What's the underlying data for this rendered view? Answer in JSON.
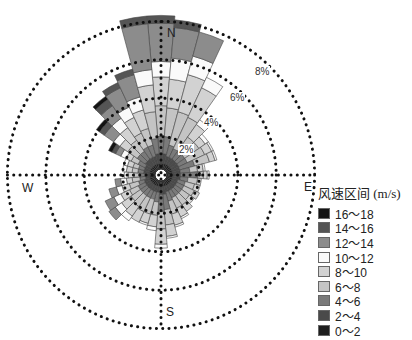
{
  "chart_data": {
    "type": "windrose",
    "title": "",
    "legend_title": "风速区间 (m/s)",
    "directions": [
      "N",
      "E",
      "S",
      "W"
    ],
    "ring_labels": [
      "2%",
      "4%",
      "6%",
      "8%"
    ],
    "ring_values": [
      2,
      4,
      6,
      8
    ],
    "speed_bins": [
      "0~2",
      "2~4",
      "4~6",
      "6~8",
      "8~10",
      "10~12",
      "12~14",
      "14~16",
      "16~18"
    ],
    "legend_order": [
      "16~18",
      "14~16",
      "12~14",
      "10~12",
      "8~10",
      "6~8",
      "4~6",
      "2~4",
      "0~2"
    ],
    "bin_colors": [
      "#1e1e1e",
      "#4a4a4a",
      "#7a7a7a",
      "#c4c4c4",
      "#d2d2d2",
      "#fafafa",
      "#8c8c8c",
      "#555555",
      "#141414"
    ],
    "sector_width_deg": 10,
    "sectors": [
      {
        "dir": 0,
        "values": [
          0.3,
          0.5,
          0.9,
          1.6,
          1.5,
          0.8,
          2.0,
          0.4,
          0.0
        ]
      },
      {
        "dir": 10,
        "values": [
          0.3,
          0.5,
          0.9,
          1.5,
          1.5,
          1.1,
          1.6,
          0.4,
          0.0
        ]
      },
      {
        "dir": 20,
        "values": [
          0.3,
          0.4,
          0.6,
          1.8,
          2.0,
          1.0,
          1.3,
          0.0,
          0.0
        ]
      },
      {
        "dir": 30,
        "values": [
          0.3,
          0.4,
          0.5,
          1.8,
          1.7,
          0.6,
          0.0,
          0.0,
          0.0
        ]
      },
      {
        "dir": 40,
        "values": [
          0.3,
          0.4,
          0.5,
          0.9,
          0.8,
          0.3,
          0.0,
          0.0,
          0.0
        ]
      },
      {
        "dir": 50,
        "values": [
          0.3,
          0.4,
          0.5,
          0.9,
          0.4,
          0.2,
          0.0,
          0.0,
          0.0
        ]
      },
      {
        "dir": 60,
        "values": [
          0.3,
          0.4,
          0.5,
          1.0,
          0.4,
          0.1,
          0.0,
          0.0,
          0.0
        ]
      },
      {
        "dir": 70,
        "values": [
          0.3,
          0.4,
          0.8,
          0.8,
          0.3,
          0.1,
          0.0,
          0.0,
          0.0
        ]
      },
      {
        "dir": 80,
        "values": [
          0.3,
          0.4,
          0.5,
          0.4,
          0.3,
          0.1,
          0.0,
          0.0,
          0.0
        ]
      },
      {
        "dir": 90,
        "values": [
          0.3,
          0.4,
          0.9,
          0.3,
          0.2,
          0.1,
          0.0,
          0.0,
          0.0
        ]
      },
      {
        "dir": 100,
        "values": [
          0.3,
          0.4,
          0.4,
          0.5,
          0.2,
          0.0,
          0.0,
          0.0,
          0.0
        ]
      },
      {
        "dir": 110,
        "values": [
          0.3,
          0.3,
          0.4,
          0.5,
          0.3,
          0.0,
          0.0,
          0.0,
          0.0
        ]
      },
      {
        "dir": 120,
        "values": [
          0.3,
          0.3,
          0.4,
          0.6,
          0.3,
          0.0,
          0.0,
          0.0,
          0.0
        ]
      },
      {
        "dir": 130,
        "values": [
          0.3,
          0.3,
          0.4,
          0.5,
          0.3,
          0.0,
          0.0,
          0.0,
          0.0
        ]
      },
      {
        "dir": 140,
        "values": [
          0.3,
          0.3,
          0.4,
          0.6,
          0.4,
          0.0,
          0.0,
          0.0,
          0.0
        ]
      },
      {
        "dir": 150,
        "values": [
          0.3,
          0.3,
          0.4,
          0.6,
          0.5,
          0.1,
          0.0,
          0.0,
          0.0
        ]
      },
      {
        "dir": 160,
        "values": [
          0.3,
          0.3,
          0.5,
          0.7,
          0.6,
          0.1,
          0.0,
          0.0,
          0.0
        ]
      },
      {
        "dir": 170,
        "values": [
          0.3,
          0.4,
          0.8,
          0.8,
          0.6,
          0.1,
          0.0,
          0.0,
          0.0
        ]
      },
      {
        "dir": 180,
        "values": [
          0.3,
          0.4,
          0.9,
          0.9,
          0.8,
          0.2,
          0.0,
          0.0,
          0.0
        ]
      },
      {
        "dir": 190,
        "values": [
          0.3,
          0.3,
          0.5,
          0.7,
          0.6,
          0.2,
          0.0,
          0.0,
          0.0
        ]
      },
      {
        "dir": 200,
        "values": [
          0.3,
          0.3,
          0.4,
          0.8,
          0.5,
          0.1,
          0.0,
          0.0,
          0.0
        ]
      },
      {
        "dir": 210,
        "values": [
          0.3,
          0.3,
          0.4,
          0.8,
          0.6,
          0.0,
          0.0,
          0.0,
          0.0
        ]
      },
      {
        "dir": 220,
        "values": [
          0.3,
          0.3,
          0.4,
          0.7,
          0.6,
          0.3,
          0.0,
          0.0,
          0.0
        ]
      },
      {
        "dir": 230,
        "values": [
          0.3,
          0.3,
          0.4,
          0.6,
          0.6,
          0.4,
          0.4,
          0.0,
          0.0
        ]
      },
      {
        "dir": 240,
        "values": [
          0.3,
          0.3,
          0.4,
          0.5,
          0.5,
          0.4,
          0.5,
          0.0,
          0.0
        ]
      },
      {
        "dir": 250,
        "values": [
          0.3,
          0.3,
          0.3,
          0.5,
          0.4,
          0.3,
          0.4,
          0.0,
          0.0
        ]
      },
      {
        "dir": 260,
        "values": [
          0.3,
          0.2,
          0.3,
          0.4,
          0.3,
          0.3,
          0.3,
          0.0,
          0.0
        ]
      },
      {
        "dir": 270,
        "values": [
          0.3,
          0.2,
          0.3,
          0.3,
          0.3,
          0.2,
          0.0,
          0.0,
          0.0
        ]
      },
      {
        "dir": 280,
        "values": [
          0.3,
          0.3,
          0.3,
          0.3,
          0.3,
          0.2,
          0.0,
          0.0,
          0.0
        ]
      },
      {
        "dir": 290,
        "values": [
          0.3,
          0.3,
          0.3,
          0.3,
          0.3,
          0.2,
          0.0,
          0.0,
          0.0
        ]
      },
      {
        "dir": 300,
        "values": [
          0.3,
          0.3,
          0.4,
          0.4,
          0.3,
          0.3,
          0.3,
          0.2,
          0.2
        ]
      },
      {
        "dir": 310,
        "values": [
          0.3,
          0.4,
          0.5,
          0.6,
          0.5,
          0.4,
          0.6,
          0.3,
          0.2
        ]
      },
      {
        "dir": 320,
        "values": [
          0.3,
          0.4,
          0.5,
          0.7,
          0.8,
          0.6,
          0.8,
          0.4,
          0.2
        ]
      },
      {
        "dir": 330,
        "values": [
          0.3,
          0.4,
          0.6,
          0.8,
          0.9,
          0.6,
          1.1,
          0.3,
          0.0
        ]
      },
      {
        "dir": 340,
        "values": [
          0.3,
          0.4,
          0.6,
          0.9,
          1.0,
          0.7,
          1.2,
          0.3,
          0.0
        ]
      },
      {
        "dir": 350,
        "values": [
          0.3,
          0.5,
          0.8,
          1.4,
          1.4,
          0.8,
          2.4,
          0.4,
          0.0
        ]
      }
    ]
  },
  "legend": {
    "title": "风速区间 (m/s)",
    "items": [
      {
        "label": "16～18",
        "color": "#141414"
      },
      {
        "label": "14～16",
        "color": "#555555"
      },
      {
        "label": "12～14",
        "color": "#8c8c8c"
      },
      {
        "label": "10～12",
        "color": "#fafafa"
      },
      {
        "label": "8～10",
        "color": "#d2d2d2"
      },
      {
        "label": "6～8",
        "color": "#c4c4c4"
      },
      {
        "label": "4～6",
        "color": "#7a7a7a"
      },
      {
        "label": "2～4",
        "color": "#4a4a4a"
      },
      {
        "label": "0～2",
        "color": "#1e1e1e"
      }
    ]
  },
  "labels": {
    "north": "N",
    "east": "E",
    "south": "S",
    "west": "W",
    "ring_2": "2%",
    "ring_4": "4%",
    "ring_6": "6%",
    "ring_8": "8%"
  },
  "colors": {
    "grid": "#111111",
    "petal_stroke": "#444444",
    "background": "#ffffff"
  }
}
